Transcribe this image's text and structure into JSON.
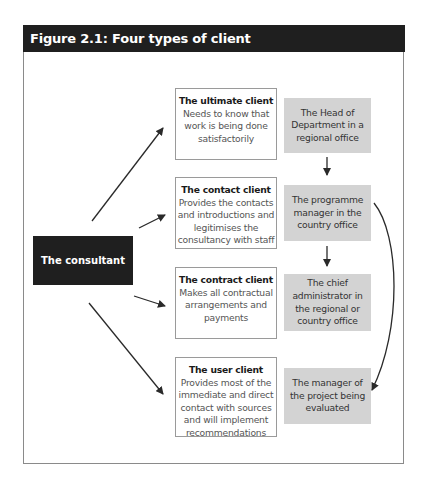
{
  "figure": {
    "title": "Figure 2.1: Four types of client",
    "consultant_label": "The consultant",
    "clients": [
      {
        "title": "The ultimate client",
        "description": "Needs to know that work is being done satisfactorily"
      },
      {
        "title": "The contact client",
        "description": "Provides the contacts and introductions and legitimises the consultancy with staff"
      },
      {
        "title": "The contract client",
        "description": "Makes all contractual arrangements and payments"
      },
      {
        "title": "The user client",
        "description": "Provides most of the immediate and direct contact with sources and will implement recommendations"
      }
    ],
    "roles": [
      {
        "label": "The Head of Department in a regional office"
      },
      {
        "label": "The programme manager in the country office"
      },
      {
        "label": "The chief administrator in the regional or country office"
      },
      {
        "label": "The manager of the project being evaluated"
      }
    ],
    "colors": {
      "header_bg": "#1f1f1f",
      "role_bg": "#d3d3d3",
      "border": "#9a9a9a"
    }
  }
}
